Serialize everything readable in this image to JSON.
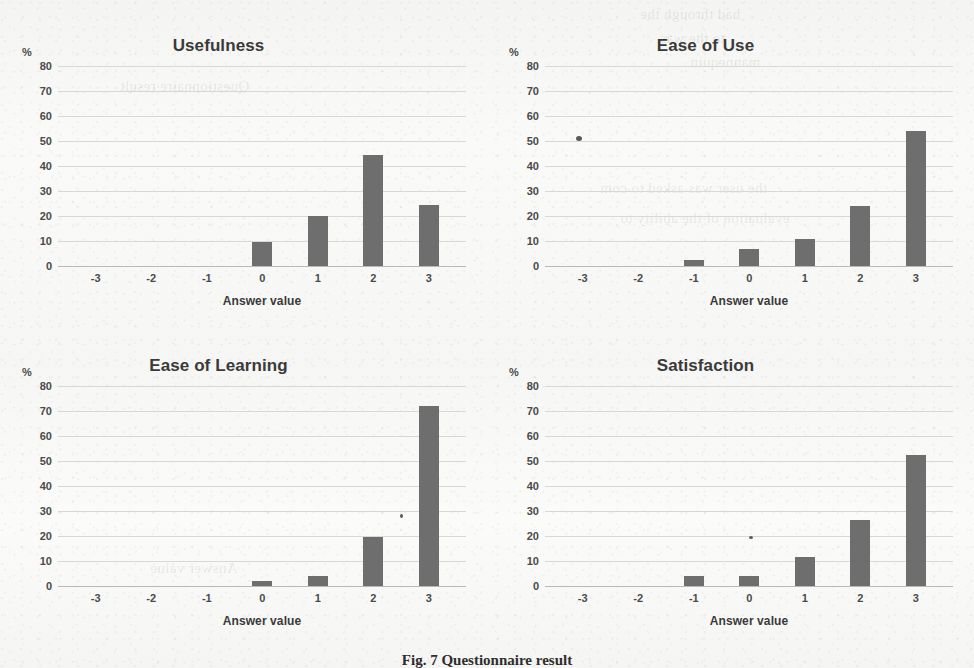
{
  "figure": {
    "caption": "Fig. 7  Questionnaire result",
    "bar_color": "#6e6e6e",
    "grid_color": "#d8d8d6",
    "axis_color": "#b9b9b7",
    "background_color": "#f7f7f5"
  },
  "bleed_through": [
    "had through the",
    "to the was",
    "mannequin",
    "Questionnaire result",
    "the user was asked to com",
    "evaluation of the ability to",
    "Answer value"
  ],
  "chart_data": [
    {
      "type": "bar",
      "title": "Usefulness",
      "xlabel": "Answer value",
      "ylabel": "%",
      "categories": [
        "-3",
        "-2",
        "-1",
        "0",
        "1",
        "2",
        "3"
      ],
      "values": [
        0,
        0,
        0,
        9.5,
        20,
        44.5,
        24.5
      ],
      "ylim": [
        0,
        80
      ],
      "yticks": [
        "80",
        "70",
        "60",
        "50",
        "40",
        "30",
        "20",
        "10",
        "0"
      ],
      "grid": true,
      "legend": "none"
    },
    {
      "type": "bar",
      "title": "Ease of Use",
      "xlabel": "Answer value",
      "ylabel": "%",
      "categories": [
        "-3",
        "-2",
        "-1",
        "0",
        "1",
        "2",
        "3"
      ],
      "values": [
        0,
        0,
        2.5,
        7,
        10.8,
        24,
        54
      ],
      "ylim": [
        0,
        80
      ],
      "yticks": [
        "80",
        "70",
        "60",
        "50",
        "40",
        "30",
        "20",
        "10",
        "0"
      ],
      "grid": true,
      "legend": "none"
    },
    {
      "type": "bar",
      "title": "Ease of Learning",
      "xlabel": "Answer value",
      "ylabel": "%",
      "categories": [
        "-3",
        "-2",
        "-1",
        "0",
        "1",
        "2",
        "3"
      ],
      "values": [
        0,
        0,
        0,
        2,
        4,
        19.5,
        72
      ],
      "ylim": [
        0,
        80
      ],
      "yticks": [
        "80",
        "70",
        "60",
        "50",
        "40",
        "30",
        "20",
        "10",
        "0"
      ],
      "grid": true,
      "legend": "none"
    },
    {
      "type": "bar",
      "title": "Satisfaction",
      "xlabel": "Answer value",
      "ylabel": "%",
      "categories": [
        "-3",
        "-2",
        "-1",
        "0",
        "1",
        "2",
        "3"
      ],
      "values": [
        0,
        0,
        4,
        4,
        11.5,
        26.5,
        52.5
      ],
      "ylim": [
        0,
        80
      ],
      "yticks": [
        "80",
        "70",
        "60",
        "50",
        "40",
        "30",
        "20",
        "10",
        "0"
      ],
      "grid": true,
      "legend": "none"
    }
  ]
}
